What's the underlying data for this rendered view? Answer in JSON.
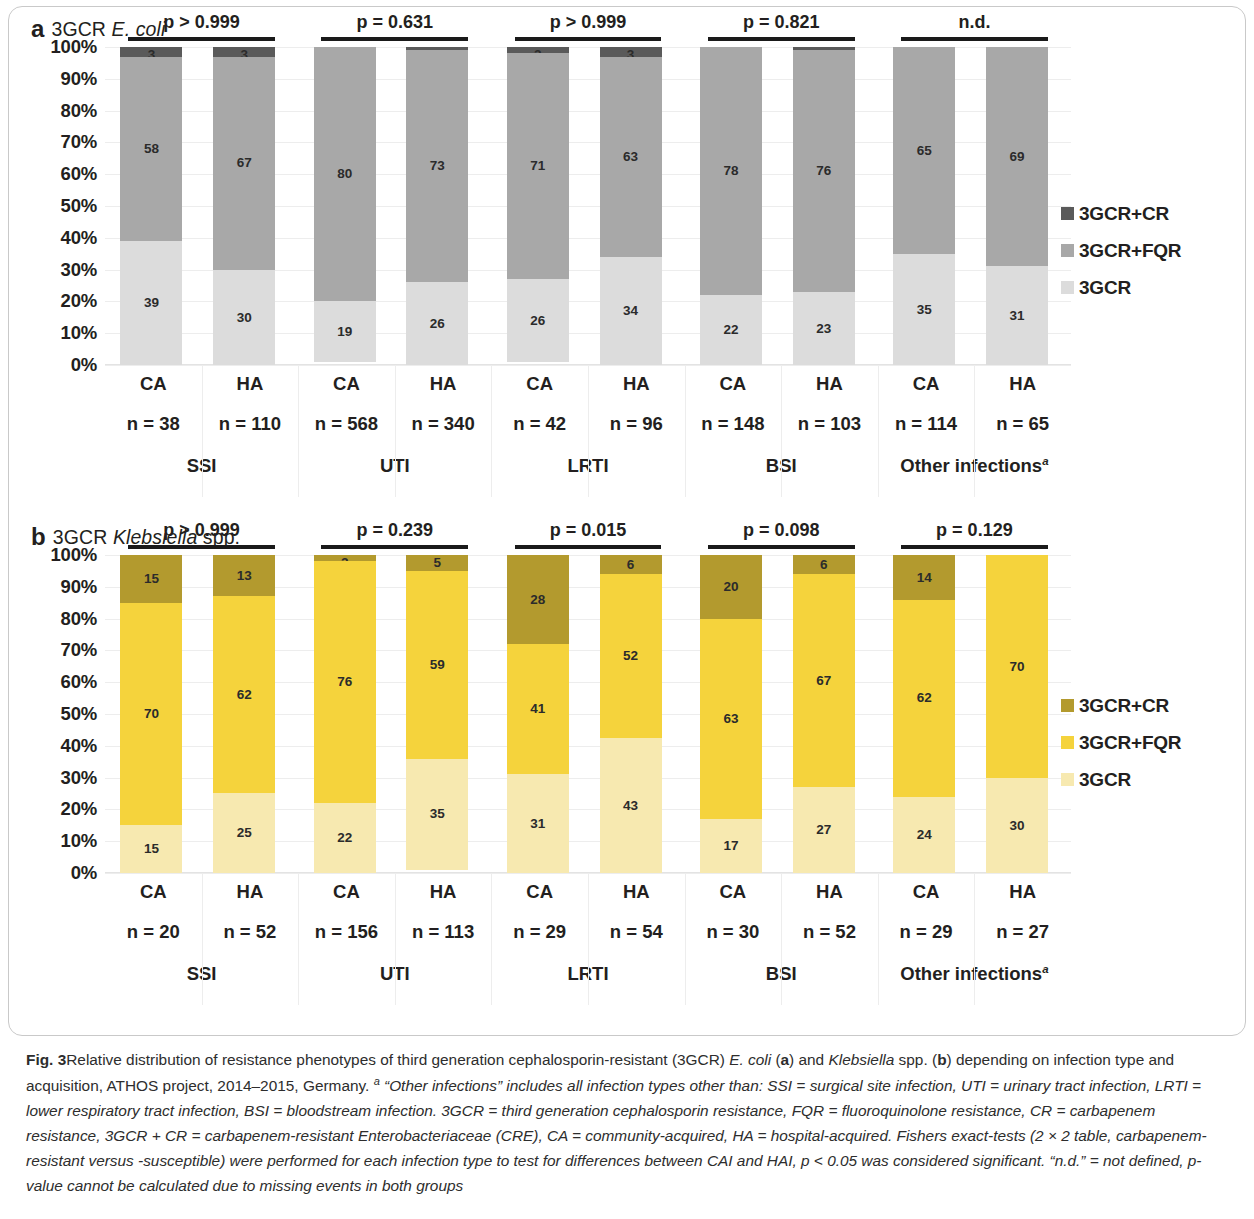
{
  "figure": {
    "number": "Fig. 3",
    "caption_part1": "Relative distribution of resistance phenotypes of third generation cephalosporin-resistant (3GCR) ",
    "caption_ecoli": "E. coli",
    "caption_part2": " (",
    "caption_a": "a",
    "caption_part3": ") and ",
    "caption_kleb": "Klebsiella",
    "caption_part4": " spp. (",
    "caption_b": "b",
    "caption_part5": ") depending on infection type and acquisition, ATHOS project, 2014–2015, Germany. ",
    "caption_sup": "a",
    "caption_italic": " “Other infections” includes all infection types other than: SSI = surgical site infection, UTI = urinary tract infection, LRTI = lower respiratory tract infection, BSI = bloodstream infection. 3GCR = third generation cephalosporin resistance, FQR = fluoroquinolone resistance, CR = carbapenem resistance, 3GCR + CR = carbapenem-resistant Enterobacteriaceae (CRE), CA = community-acquired, HA = hospital-acquired. Fishers exact-tests (2 × 2 table, carbapenem-resistant versus -susceptible) were performed for each infection type to test for differences between CAI and HAI, p < 0.05 was considered significant. “n.d.” = not defined, p-value cannot be calculated due to missing events in both groups"
  },
  "panel_a": {
    "letter": "a",
    "title_prefix": "3GCR ",
    "title_italic": "E. coli",
    "title_suffix": ""
  },
  "panel_b": {
    "letter": "b",
    "title_prefix": "3GCR ",
    "title_italic": "Klebsiella",
    "title_suffix": " spp."
  },
  "yticks": [
    "100%",
    "90%",
    "80%",
    "70%",
    "60%",
    "50%",
    "40%",
    "30%",
    "20%",
    "10%",
    "0%"
  ],
  "legend_a": {
    "items": [
      {
        "label": "3GCR+CR",
        "color": "#5a5a5a"
      },
      {
        "label": "3GCR+FQR",
        "color": "#a8a8a8"
      },
      {
        "label": "3GCR",
        "color": "#dcdcdc"
      }
    ]
  },
  "legend_b": {
    "items": [
      {
        "label": "3GCR+CR",
        "color": "#b39a2e"
      },
      {
        "label": "3GCR+FQR",
        "color": "#f5d33c"
      },
      {
        "label": "3GCR",
        "color": "#f7e9b0"
      }
    ]
  },
  "chart_data": [
    {
      "id": "panel-a",
      "type": "bar",
      "subtype": "stacked-100-percent",
      "title": "3GCR E. coli",
      "xlabel": "",
      "ylabel": "",
      "ylim": [
        0,
        100
      ],
      "ytick_values": [
        0,
        10,
        20,
        30,
        40,
        50,
        60,
        70,
        80,
        90,
        100
      ],
      "grid": true,
      "legend_position": "right",
      "stack_order_bottom_to_top": [
        "3GCR",
        "3GCR+FQR",
        "3GCR+CR"
      ],
      "colors": {
        "3GCR": "#dcdcdc",
        "3GCR+FQR": "#a8a8a8",
        "3GCR+CR": "#5a5a5a"
      },
      "groups": [
        {
          "infection_type": "SSI",
          "p_label": "p > 0.999",
          "bars": [
            {
              "acquisition": "CA",
              "n_label": "n = 38",
              "n": 38,
              "3GCR": 39,
              "3GCR+FQR": 58,
              "3GCR+CR": 3
            },
            {
              "acquisition": "HA",
              "n_label": "n = 110",
              "n": 110,
              "3GCR": 30,
              "3GCR+FQR": 67,
              "3GCR+CR": 3
            }
          ]
        },
        {
          "infection_type": "UTI",
          "p_label": "p = 0.631",
          "bars": [
            {
              "acquisition": "CA",
              "n_label": "n = 568",
              "n": 568,
              "3GCR": 19,
              "3GCR+FQR": 80,
              "3GCR+CR": 0
            },
            {
              "acquisition": "HA",
              "n_label": "n = 340",
              "n": 340,
              "3GCR": 26,
              "3GCR+FQR": 73,
              "3GCR+CR": 1
            }
          ]
        },
        {
          "infection_type": "LRTI",
          "p_label": "p > 0.999",
          "bars": [
            {
              "acquisition": "CA",
              "n_label": "n = 42",
              "n": 42,
              "3GCR": 26,
              "3GCR+FQR": 71,
              "3GCR+CR": 2
            },
            {
              "acquisition": "HA",
              "n_label": "n = 96",
              "n": 96,
              "3GCR": 34,
              "3GCR+FQR": 63,
              "3GCR+CR": 3
            }
          ]
        },
        {
          "infection_type": "BSI",
          "p_label": "p = 0.821",
          "bars": [
            {
              "acquisition": "CA",
              "n_label": "n = 148",
              "n": 148,
              "3GCR": 22,
              "3GCR+FQR": 78,
              "3GCR+CR": 0
            },
            {
              "acquisition": "HA",
              "n_label": "n = 103",
              "n": 103,
              "3GCR": 23,
              "3GCR+FQR": 76,
              "3GCR+CR": 1
            }
          ]
        },
        {
          "infection_type": "Other infections",
          "infection_type_sup": "a",
          "p_label": "n.d.",
          "bars": [
            {
              "acquisition": "CA",
              "n_label": "n = 114",
              "n": 114,
              "3GCR": 35,
              "3GCR+FQR": 65,
              "3GCR+CR": 0
            },
            {
              "acquisition": "HA",
              "n_label": "n = 65",
              "n": 65,
              "3GCR": 31,
              "3GCR+FQR": 69,
              "3GCR+CR": 0
            }
          ]
        }
      ]
    },
    {
      "id": "panel-b",
      "type": "bar",
      "subtype": "stacked-100-percent",
      "title": "3GCR Klebsiella spp.",
      "xlabel": "",
      "ylabel": "",
      "ylim": [
        0,
        100
      ],
      "ytick_values": [
        0,
        10,
        20,
        30,
        40,
        50,
        60,
        70,
        80,
        90,
        100
      ],
      "grid": true,
      "legend_position": "right",
      "stack_order_bottom_to_top": [
        "3GCR",
        "3GCR+FQR",
        "3GCR+CR"
      ],
      "colors": {
        "3GCR": "#f7e9b0",
        "3GCR+FQR": "#f5d33c",
        "3GCR+CR": "#b39a2e"
      },
      "groups": [
        {
          "infection_type": "SSI",
          "p_label": "p > 0.999",
          "bars": [
            {
              "acquisition": "CA",
              "n_label": "n = 20",
              "n": 20,
              "3GCR": 15,
              "3GCR+FQR": 70,
              "3GCR+CR": 15
            },
            {
              "acquisition": "HA",
              "n_label": "n = 52",
              "n": 52,
              "3GCR": 25,
              "3GCR+FQR": 62,
              "3GCR+CR": 13
            }
          ]
        },
        {
          "infection_type": "UTI",
          "p_label": "p = 0.239",
          "bars": [
            {
              "acquisition": "CA",
              "n_label": "n = 156",
              "n": 156,
              "3GCR": 22,
              "3GCR+FQR": 76,
              "3GCR+CR": 2
            },
            {
              "acquisition": "HA",
              "n_label": "n = 113",
              "n": 113,
              "3GCR": 35,
              "3GCR+FQR": 59,
              "3GCR+CR": 5
            }
          ]
        },
        {
          "infection_type": "LRTI",
          "p_label": "p = 0.015",
          "bars": [
            {
              "acquisition": "CA",
              "n_label": "n = 29",
              "n": 29,
              "3GCR": 31,
              "3GCR+FQR": 41,
              "3GCR+CR": 28
            },
            {
              "acquisition": "HA",
              "n_label": "n = 54",
              "n": 54,
              "3GCR": 43,
              "3GCR+FQR": 52,
              "3GCR+CR": 6
            }
          ]
        },
        {
          "infection_type": "BSI",
          "p_label": "p = 0.098",
          "bars": [
            {
              "acquisition": "CA",
              "n_label": "n = 30",
              "n": 30,
              "3GCR": 17,
              "3GCR+FQR": 63,
              "3GCR+CR": 20
            },
            {
              "acquisition": "HA",
              "n_label": "n = 52",
              "n": 52,
              "3GCR": 27,
              "3GCR+FQR": 67,
              "3GCR+CR": 6
            }
          ]
        },
        {
          "infection_type": "Other infections",
          "infection_type_sup": "a",
          "p_label": "p = 0.129",
          "bars": [
            {
              "acquisition": "CA",
              "n_label": "n = 29",
              "n": 29,
              "3GCR": 24,
              "3GCR+FQR": 62,
              "3GCR+CR": 14
            },
            {
              "acquisition": "HA",
              "n_label": "n = 27",
              "n": 27,
              "3GCR": 30,
              "3GCR+FQR": 70,
              "3GCR+CR": 0
            }
          ]
        }
      ]
    }
  ]
}
